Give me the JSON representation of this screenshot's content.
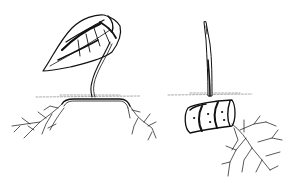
{
  "illustration": {
    "style": "black-and-white botanical line drawing",
    "colors": {
      "background": "#ffffff",
      "ink": "#111111",
      "soil": "#8a8a8a"
    },
    "panels": [
      {
        "name": "leaf-cutting",
        "description": "heart-shaped leaf on curved petiole, rooted horizontally below soil line"
      },
      {
        "name": "cane-cutting",
        "description": "segmented cane section laid horizontally with an upright shoot and branching roots"
      }
    ]
  }
}
